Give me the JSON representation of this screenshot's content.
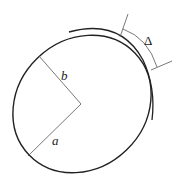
{
  "diagram": {
    "type": "ellipse-with-offset-arc",
    "labels": {
      "semi_minor": "b",
      "semi_major": "a",
      "gap": "Δ"
    },
    "colors": {
      "stroke": "#222222",
      "thin_stroke": "#555555",
      "background": "#ffffff"
    }
  }
}
